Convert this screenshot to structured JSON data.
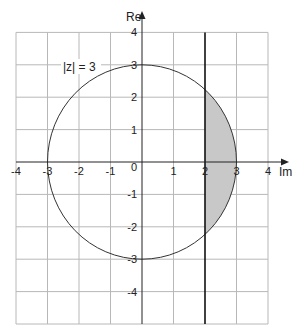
{
  "diagram": {
    "type": "complex-plane-region",
    "axes": {
      "horizontal_label": "Im",
      "vertical_label": "Re",
      "x_ticks": [
        "-4",
        "-3",
        "-2",
        "-1",
        "1",
        "2",
        "3",
        "4"
      ],
      "y_ticks": [
        "4",
        "3",
        "2",
        "1",
        "-1",
        "-2",
        "-3",
        "-4"
      ],
      "origin_label": "0",
      "x_range": [
        -4,
        4
      ],
      "y_range": [
        -5,
        4
      ]
    },
    "circle": {
      "label": "|z| = 3",
      "radius": 3,
      "center": [
        0,
        0
      ]
    },
    "line": {
      "description": "vertical line at Im = 2",
      "value": 2
    },
    "shaded_region": {
      "description": "part of disk |z| <= 3 with Im >= 2",
      "fill": "#c8c8c8"
    },
    "colors": {
      "grid": "#b8b8b8",
      "axis": "#222222",
      "circle": "#333333",
      "bold_line": "#111111",
      "shade": "#c8c8c8"
    }
  }
}
